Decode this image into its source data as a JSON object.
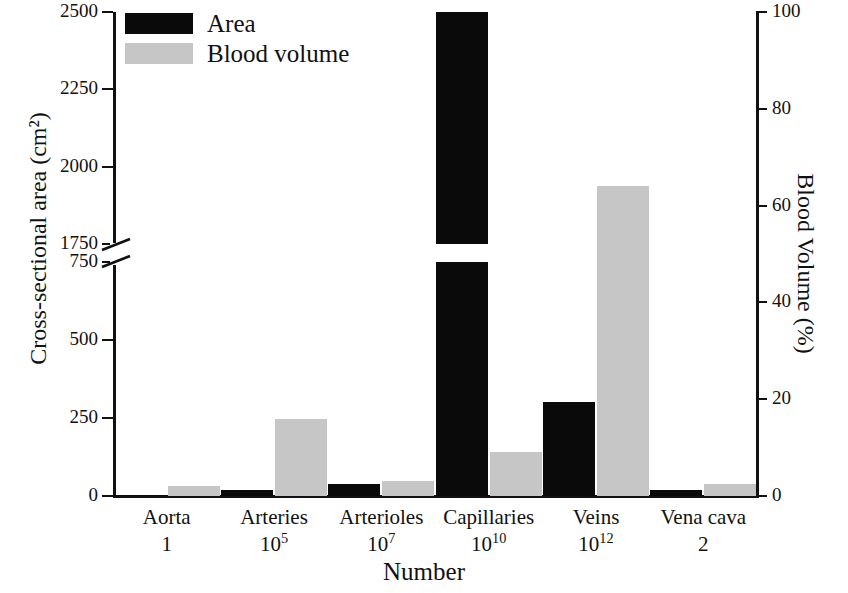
{
  "chart_data": {
    "type": "bar",
    "title": "",
    "xlabel": "Number",
    "ylabel": "Cross-sectional area (cm²)",
    "ylabel_right": "Blood Volume (%)",
    "categories": [
      "Aorta",
      "Arteries",
      "Arterioles",
      "Capillaries",
      "Veins",
      "Vena cava"
    ],
    "category_numbers": [
      "1",
      "10⁵",
      "10⁷",
      "10¹⁰",
      "10¹²",
      "2"
    ],
    "series": [
      {
        "name": "Area",
        "color": "#0a0a0a",
        "axis": "left",
        "unit": "cm²",
        "values": [
          4,
          20,
          40,
          2500,
          300,
          18
        ]
      },
      {
        "name": "Blood volume",
        "color": "#c6c6c6",
        "axis": "right",
        "unit": "%",
        "values": [
          2,
          16,
          3,
          9,
          64,
          2.5
        ],
        "values_left_axis_equivalent": [
          10,
          240,
          40,
          140,
          1900,
          35
        ]
      }
    ],
    "left_axis": {
      "ticks": [
        "0",
        "250",
        "500",
        "750",
        "1750",
        "2000",
        "2250",
        "2500"
      ],
      "broken": true,
      "break_between": [
        "750",
        "1750"
      ],
      "lower_range": [
        0,
        750
      ],
      "upper_range": [
        1750,
        2500
      ]
    },
    "right_axis": {
      "ticks": [
        "0",
        "20",
        "40",
        "60",
        "80",
        "100"
      ],
      "range": [
        0,
        100
      ]
    },
    "grid": false,
    "legend_position": "top-left",
    "legend": [
      "Area",
      "Blood volume"
    ]
  },
  "legend": {
    "area_label": "Area",
    "blood_label": "Blood volume"
  },
  "axes": {
    "left_title": "Cross-sectional area (cm²)",
    "right_title": "Blood Volume (%)",
    "bottom_title": "Number"
  }
}
